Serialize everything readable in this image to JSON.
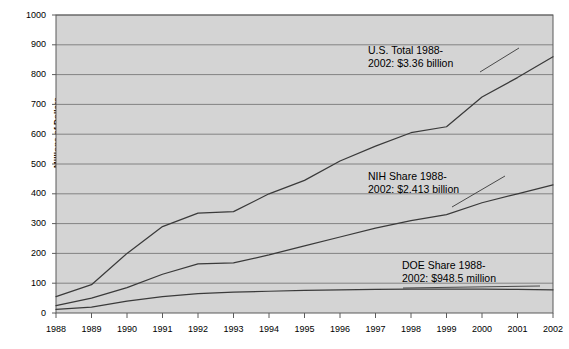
{
  "chart_data": {
    "type": "line",
    "title": "",
    "subtitle": "",
    "xlabel": "",
    "ylabel": "Millions of Dollars",
    "xlim": [
      1988,
      2002
    ],
    "ylim": [
      0,
      1000
    ],
    "ytick_interval": 100,
    "grid": true,
    "grid_orientation": "horizontal",
    "legend_position": "none",
    "plot_background": "#d4d4d4",
    "line_color": "#3a3a3a",
    "categories": [
      "1988",
      "1989",
      "1990",
      "1991",
      "1992",
      "1993",
      "1994",
      "1995",
      "1996",
      "1997",
      "1998",
      "1999",
      "2000",
      "2001",
      "2002"
    ],
    "x": [
      1988,
      1989,
      1990,
      1991,
      1992,
      1993,
      1994,
      1995,
      1996,
      1997,
      1998,
      1999,
      2000,
      2001,
      2002
    ],
    "yticks": [
      "0",
      "100",
      "200",
      "300",
      "400",
      "500",
      "600",
      "700",
      "800",
      "900",
      "1000"
    ],
    "series": [
      {
        "name": "U.S. Total",
        "values": [
          55,
          95,
          200,
          290,
          335,
          340,
          400,
          445,
          510,
          560,
          605,
          625,
          725,
          790,
          860
        ]
      },
      {
        "name": "NIH Share",
        "values": [
          25,
          50,
          85,
          130,
          165,
          168,
          195,
          225,
          255,
          285,
          310,
          330,
          370,
          400,
          430
        ]
      },
      {
        "name": "DOE Share",
        "values": [
          12,
          20,
          40,
          55,
          65,
          70,
          73,
          76,
          78,
          79,
          80,
          80,
          80,
          79,
          78
        ]
      }
    ],
    "annotations": [
      {
        "id": "us-total",
        "line1": "U.S. Total 1988-",
        "line2": "2002: $3.36 billion"
      },
      {
        "id": "nih-share",
        "line1": "NIH Share 1988-",
        "line2": "2002: $2.413 billion"
      },
      {
        "id": "doe-share",
        "line1": "DOE Share 1988-",
        "line2": "2002: $948.5 million"
      }
    ]
  }
}
